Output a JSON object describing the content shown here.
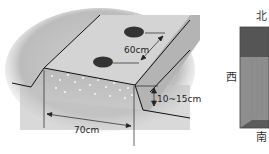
{
  "ridge_diagram": {
    "labels": {
      "spacing": "60cm",
      "height": "10~15cm",
      "width": "70cm"
    },
    "colors": {
      "soil_light": "#d6d6d6",
      "soil_mid": "#bdbdbd",
      "soil_dark": "#a8a8a8",
      "seed_hole": "#333333",
      "outline": "#111111"
    }
  },
  "compass_view": {
    "directions": {
      "north": "北",
      "west": "西",
      "south": "南"
    },
    "colors": {
      "top_band": "#555555",
      "body": "#8c8c8c",
      "bottom_band": "#5a5a5a"
    }
  }
}
